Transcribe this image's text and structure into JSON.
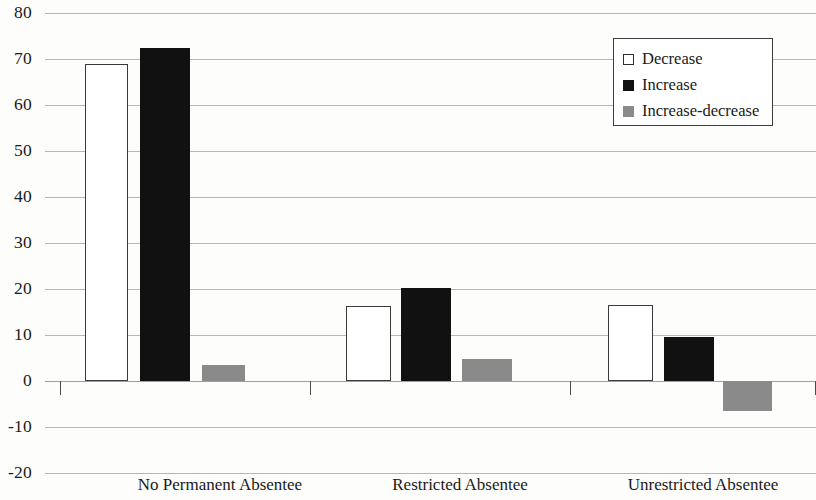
{
  "chart_data": {
    "type": "bar",
    "title": "",
    "subtitle": "",
    "xlabel": "",
    "ylabel": "",
    "categories": [
      "No Permanent Absentee",
      "Restricted Absentee",
      "Unrestricted Absentee"
    ],
    "series": [
      {
        "name": "Decrease",
        "color": "#ffffff",
        "values": [
          69,
          16.3,
          16.5
        ]
      },
      {
        "name": "Increase",
        "color": "#111111",
        "values": [
          72.3,
          20.3,
          9.6
        ]
      },
      {
        "name": "Increase-decrease",
        "color": "#8a8a8a",
        "values": [
          3.4,
          4.7,
          -6.6
        ]
      }
    ],
    "ylim": [
      -20,
      80
    ],
    "yticks": [
      80,
      70,
      60,
      50,
      40,
      30,
      20,
      10,
      0,
      -10,
      -20
    ],
    "ytick_labels": [
      "80",
      "70",
      "60",
      "50",
      "40",
      "30",
      "20",
      "10",
      "0",
      "-10",
      "-20"
    ],
    "grid": true,
    "grid_axis": "y",
    "legend_position": "top-right",
    "legend_entries": [
      "Decrease",
      "Increase",
      "Increase-decrease"
    ],
    "annotations": []
  }
}
